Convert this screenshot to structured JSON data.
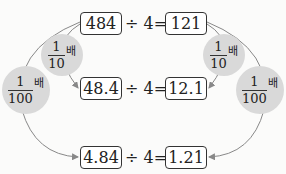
{
  "rows": [
    {
      "dividend": "484",
      "operator": "÷",
      "divisor": "4",
      "equals": "=",
      "quotient": "121"
    },
    {
      "dividend": "48.4",
      "operator": "÷",
      "divisor": "4",
      "equals": "=",
      "quotient": "12.1"
    },
    {
      "dividend": "4.84",
      "operator": "÷",
      "divisor": "4",
      "equals": "=",
      "quotient": "1.21"
    }
  ],
  "labels": {
    "left_inner": {
      "numerator": "1",
      "denominator": "10",
      "suffix": "배"
    },
    "left_outer": {
      "numerator": "1",
      "denominator": "100",
      "suffix": "배"
    },
    "right_inner": {
      "numerator": "1",
      "denominator": "10",
      "suffix": "배"
    },
    "right_outer": {
      "numerator": "1",
      "denominator": "100",
      "suffix": "배"
    }
  },
  "colors": {
    "bubble": "#d9d9d9",
    "arrow": "#888888",
    "box_border": "#333333"
  }
}
